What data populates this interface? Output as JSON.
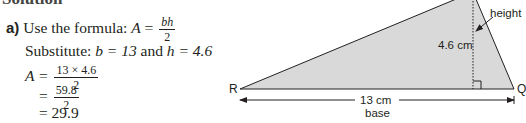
{
  "heading_fragment": "Solution",
  "part_label": "a)",
  "steps": {
    "formula_text": "Use the formula:",
    "formula_lhs": "A",
    "formula_num": "bh",
    "formula_den": "2",
    "substitute_text": "Substitute:",
    "substitute_b": "b = 13",
    "substitute_and": "and",
    "substitute_h": "h = 4.6",
    "step1_lhs": "A =",
    "step1_num": "13 × 4.6",
    "step1_den": "2",
    "step2_eq": "=",
    "step2_num": "59.8",
    "step2_den": "2",
    "step3": "= 29.9"
  },
  "diagram": {
    "vertex_left": "R",
    "vertex_right": "Q",
    "height_value": "4.6 cm",
    "height_label": "height",
    "base_value": "13 cm",
    "base_label": "base",
    "fill_color": "#d9d9d9",
    "stroke_color": "#231f20"
  }
}
